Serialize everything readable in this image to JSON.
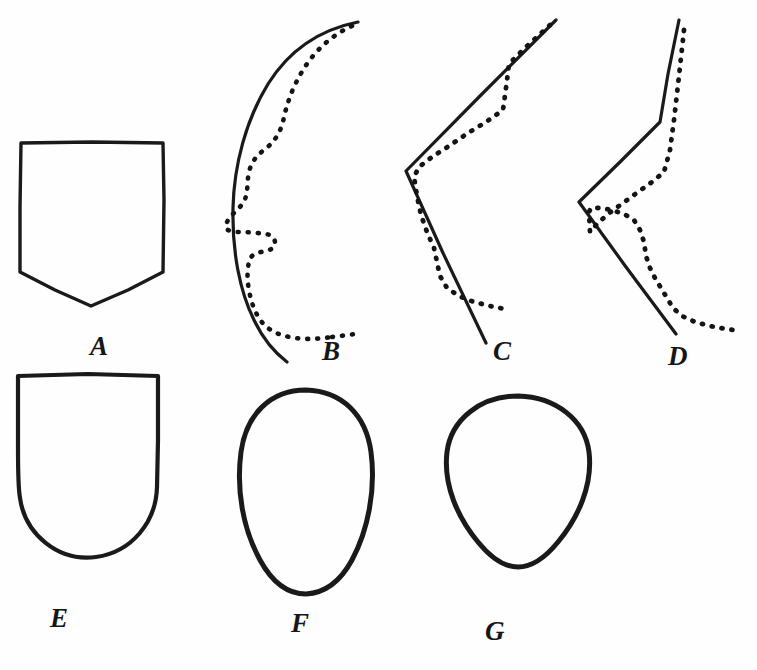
{
  "figure": {
    "kind": "line-drawing-plate",
    "background_color": "#ffffff",
    "ink_color": "#1a1a1a",
    "panel_count": 7
  },
  "panels": [
    {
      "id": "A",
      "label": "A",
      "row": "top",
      "description": "Shield outline: flat top, straight vertical sides, lower edges converging to a point",
      "style": "solid",
      "has_dashed_overlay": false
    },
    {
      "id": "B",
      "label": "B",
      "row": "top",
      "description": "Convex solid arc with an irregular dotted curve running inside it",
      "style": "solid",
      "has_dashed_overlay": true
    },
    {
      "id": "C",
      "label": "C",
      "row": "top",
      "description": "Open chevron pointing left, solid limbs with a parallel dotted trace",
      "style": "solid",
      "has_dashed_overlay": true
    },
    {
      "id": "D",
      "label": "D",
      "row": "top",
      "description": "Steep chevron with near-vertical upper limb, solid with dotted trace flaring right at base",
      "style": "solid",
      "has_dashed_overlay": true
    },
    {
      "id": "E",
      "label": "E",
      "row": "bottom",
      "description": "U-shield: flat top, straight sides, broad rounded base",
      "style": "solid",
      "has_dashed_overlay": false
    },
    {
      "id": "F",
      "label": "F",
      "row": "bottom",
      "description": "Tall ovoid, broad at the top and tapering to a narrow rounded base",
      "style": "solid",
      "has_dashed_overlay": false
    },
    {
      "id": "G",
      "label": "G",
      "row": "bottom",
      "description": "Rounded teardrop, wide shoulders narrowing to a blunt base",
      "style": "solid",
      "has_dashed_overlay": false
    }
  ],
  "labels": {
    "a": "A",
    "b": "B",
    "c": "C",
    "d": "D",
    "e": "E",
    "f": "F",
    "g": "G"
  }
}
